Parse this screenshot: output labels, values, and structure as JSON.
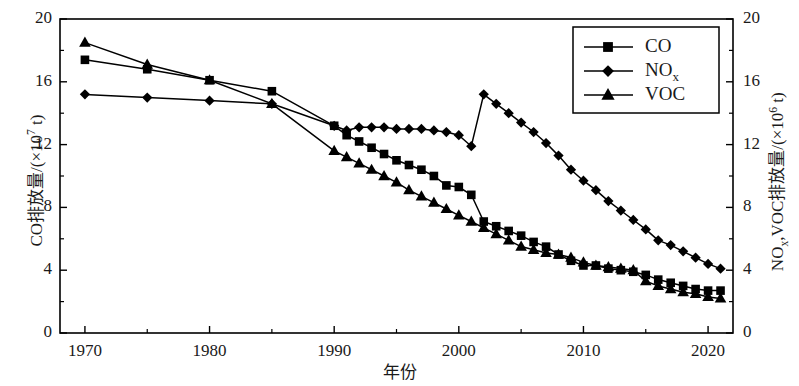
{
  "chart_data": {
    "type": "line",
    "title": "",
    "xlabel": "年份",
    "ylabel_left": "CO排放量/(×10⁷ t)",
    "ylabel_right": "NOx,VOC排放量/(×10⁶ t)",
    "xlim": [
      1968,
      2022
    ],
    "xticks": [
      1970,
      1980,
      1990,
      2000,
      2010,
      2020
    ],
    "xtick_labels": [
      "1970",
      "1980",
      "1990",
      "2000",
      "2010",
      "2020"
    ],
    "x_minor_ticks": [
      1975,
      1985,
      1995,
      2005,
      2015
    ],
    "ylim_left": [
      0,
      20
    ],
    "yticks_left": [
      0,
      4,
      8,
      12,
      16,
      20
    ],
    "ytick_labels_left": [
      "0",
      "4",
      "8",
      "12",
      "16",
      "20"
    ],
    "y_minor_ticks_left": [
      2,
      6,
      10,
      14,
      18
    ],
    "ylim_right": [
      0,
      20
    ],
    "yticks_right": [
      0,
      4,
      8,
      12,
      16,
      20
    ],
    "ytick_labels_right": [
      "0",
      "4",
      "8",
      "12",
      "16",
      "20"
    ],
    "grid": false,
    "legend_position": "top-right",
    "legend_entries": [
      "CO",
      "NOx",
      "VOC"
    ],
    "series": [
      {
        "name": "CO",
        "label_html": "CO",
        "marker": "square",
        "color": "#000000",
        "axis": "left",
        "points": [
          [
            1970,
            17.4
          ],
          [
            1975,
            16.8
          ],
          [
            1980,
            16.1
          ],
          [
            1985,
            15.4
          ],
          [
            1990,
            13.2
          ],
          [
            1991,
            12.6
          ],
          [
            1992,
            12.2
          ],
          [
            1993,
            11.8
          ],
          [
            1994,
            11.4
          ],
          [
            1995,
            11.0
          ],
          [
            1996,
            10.7
          ],
          [
            1997,
            10.4
          ],
          [
            1998,
            10.0
          ],
          [
            1999,
            9.4
          ],
          [
            2000,
            9.3
          ],
          [
            2001,
            8.8
          ],
          [
            2002,
            7.1
          ],
          [
            2003,
            6.8
          ],
          [
            2004,
            6.5
          ],
          [
            2005,
            6.2
          ],
          [
            2006,
            5.8
          ],
          [
            2007,
            5.5
          ],
          [
            2008,
            5.0
          ],
          [
            2009,
            4.6
          ],
          [
            2010,
            4.3
          ],
          [
            2011,
            4.3
          ],
          [
            2012,
            4.1
          ],
          [
            2013,
            4.0
          ],
          [
            2014,
            3.9
          ],
          [
            2015,
            3.7
          ],
          [
            2016,
            3.4
          ],
          [
            2017,
            3.2
          ],
          [
            2018,
            3.0
          ],
          [
            2019,
            2.8
          ],
          [
            2020,
            2.7
          ],
          [
            2021,
            2.7
          ]
        ]
      },
      {
        "name": "NOx",
        "label_html": "NO<sub>x</sub>",
        "marker": "diamond",
        "color": "#000000",
        "axis": "right",
        "points": [
          [
            1970,
            15.2
          ],
          [
            1975,
            15.0
          ],
          [
            1980,
            14.8
          ],
          [
            1985,
            14.6
          ],
          [
            1990,
            13.2
          ],
          [
            1991,
            12.9
          ],
          [
            1992,
            13.1
          ],
          [
            1993,
            13.1
          ],
          [
            1994,
            13.1
          ],
          [
            1995,
            13.0
          ],
          [
            1996,
            13.0
          ],
          [
            1997,
            13.0
          ],
          [
            1998,
            12.9
          ],
          [
            1999,
            12.8
          ],
          [
            2000,
            12.6
          ],
          [
            2001,
            11.9
          ],
          [
            2002,
            15.2
          ],
          [
            2003,
            14.6
          ],
          [
            2004,
            14.0
          ],
          [
            2005,
            13.4
          ],
          [
            2006,
            12.8
          ],
          [
            2007,
            12.1
          ],
          [
            2008,
            11.3
          ],
          [
            2009,
            10.4
          ],
          [
            2010,
            9.7
          ],
          [
            2011,
            9.1
          ],
          [
            2012,
            8.4
          ],
          [
            2013,
            7.8
          ],
          [
            2014,
            7.2
          ],
          [
            2015,
            6.6
          ],
          [
            2016,
            5.9
          ],
          [
            2017,
            5.6
          ],
          [
            2018,
            5.2
          ],
          [
            2019,
            4.8
          ],
          [
            2020,
            4.4
          ],
          [
            2021,
            4.1
          ]
        ]
      },
      {
        "name": "VOC",
        "label_html": "VOC",
        "marker": "triangle",
        "color": "#000000",
        "axis": "right",
        "points": [
          [
            1970,
            18.5
          ],
          [
            1975,
            17.1
          ],
          [
            1980,
            16.1
          ],
          [
            1985,
            14.6
          ],
          [
            1990,
            11.6
          ],
          [
            1991,
            11.2
          ],
          [
            1992,
            10.8
          ],
          [
            1993,
            10.4
          ],
          [
            1994,
            10.0
          ],
          [
            1995,
            9.6
          ],
          [
            1996,
            9.1
          ],
          [
            1997,
            8.7
          ],
          [
            1998,
            8.3
          ],
          [
            1999,
            7.9
          ],
          [
            2000,
            7.5
          ],
          [
            2001,
            7.1
          ],
          [
            2002,
            6.7
          ],
          [
            2003,
            6.3
          ],
          [
            2004,
            5.9
          ],
          [
            2005,
            5.5
          ],
          [
            2006,
            5.3
          ],
          [
            2007,
            5.1
          ],
          [
            2008,
            5.0
          ],
          [
            2009,
            4.8
          ],
          [
            2010,
            4.5
          ],
          [
            2011,
            4.3
          ],
          [
            2012,
            4.2
          ],
          [
            2013,
            4.1
          ],
          [
            2014,
            4.0
          ],
          [
            2015,
            3.3
          ],
          [
            2016,
            3.0
          ],
          [
            2017,
            2.8
          ],
          [
            2018,
            2.6
          ],
          [
            2019,
            2.5
          ],
          [
            2020,
            2.3
          ],
          [
            2021,
            2.2
          ]
        ]
      }
    ]
  }
}
